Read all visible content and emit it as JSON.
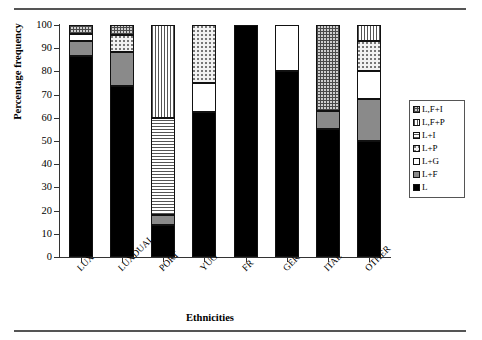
{
  "chart_data": {
    "type": "bar",
    "subtype": "stacked-percentage",
    "title": "",
    "xlabel": "Ethnicities",
    "ylabel": "Percentage frequency",
    "ylim": [
      0,
      100
    ],
    "yticks": [
      0,
      10,
      20,
      30,
      40,
      50,
      60,
      70,
      80,
      90,
      100
    ],
    "grid": false,
    "legend_position": "right",
    "categories": [
      "LUX",
      "LUXDUAL",
      "PORT",
      "YUG",
      "FR",
      "GER",
      "ITAL",
      "OTHER"
    ],
    "series": [
      {
        "name": "L",
        "pattern": "solid-black",
        "values": [
          86.5,
          73.5,
          14.0,
          62.5,
          100.0,
          80.0,
          55.0,
          50.0
        ]
      },
      {
        "name": "L+F",
        "pattern": "solid-gray",
        "values": [
          6.5,
          15.0,
          4.0,
          0.0,
          0.0,
          0.0,
          8.0,
          18.0
        ]
      },
      {
        "name": "L+G",
        "pattern": "white",
        "values": [
          3.0,
          0.0,
          0.0,
          12.5,
          0.0,
          20.0,
          0.0,
          12.0
        ]
      },
      {
        "name": "L+P",
        "pattern": "dotted",
        "values": [
          0.0,
          7.0,
          0.0,
          25.0,
          0.0,
          0.0,
          0.0,
          13.0
        ]
      },
      {
        "name": "L+I",
        "pattern": "horizontal-lines",
        "values": [
          0.0,
          0.0,
          42.0,
          0.0,
          0.0,
          0.0,
          0.0,
          0.0
        ]
      },
      {
        "name": "L,F+P",
        "pattern": "vertical-lines",
        "values": [
          0.0,
          0.0,
          40.0,
          0.0,
          0.0,
          0.0,
          0.0,
          7.0
        ]
      },
      {
        "name": "L,F+I",
        "pattern": "crosshatch",
        "values": [
          4.0,
          4.5,
          0.0,
          0.0,
          0.0,
          0.0,
          37.0,
          0.0
        ]
      }
    ],
    "legend_entries": [
      {
        "label": "L,F+I",
        "pattern": "crosshatch"
      },
      {
        "label": "L,F+P",
        "pattern": "vertical-lines"
      },
      {
        "label": "L+I",
        "pattern": "horizontal-lines"
      },
      {
        "label": "L+P",
        "pattern": "dotted"
      },
      {
        "label": "L+G",
        "pattern": "white"
      },
      {
        "label": "L+F",
        "pattern": "solid-gray"
      },
      {
        "label": "L",
        "pattern": "solid-black"
      }
    ]
  }
}
